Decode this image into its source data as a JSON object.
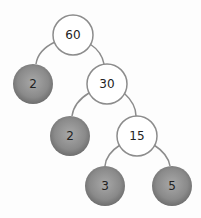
{
  "diagram": {
    "type": "factor-tree",
    "root": "60",
    "nodes": [
      {
        "id": "n60",
        "label": "60",
        "cx": 73,
        "cy": 35,
        "kind": "composite"
      },
      {
        "id": "n2a",
        "label": "2",
        "cx": 33,
        "cy": 84,
        "kind": "prime"
      },
      {
        "id": "n30",
        "label": "30",
        "cx": 107,
        "cy": 84,
        "kind": "composite"
      },
      {
        "id": "n2b",
        "label": "2",
        "cx": 70,
        "cy": 136,
        "kind": "prime"
      },
      {
        "id": "n15",
        "label": "15",
        "cx": 137,
        "cy": 136,
        "kind": "composite"
      },
      {
        "id": "n3",
        "label": "3",
        "cx": 105,
        "cy": 186,
        "kind": "prime"
      },
      {
        "id": "n5",
        "label": "5",
        "cx": 172,
        "cy": 186,
        "kind": "prime"
      }
    ],
    "edges": [
      [
        "60",
        "2"
      ],
      [
        "60",
        "30"
      ],
      [
        "30",
        "2"
      ],
      [
        "30",
        "15"
      ],
      [
        "15",
        "3"
      ],
      [
        "15",
        "5"
      ]
    ],
    "colors": {
      "composite_fill": "#ffffff",
      "prime_fill": "#8a8a8a",
      "stroke": "#8c8c8c"
    }
  },
  "labels": {
    "n60": "60",
    "n2a": "2",
    "n30": "30",
    "n2b": "2",
    "n15": "15",
    "n3": "3",
    "n5": "5"
  }
}
